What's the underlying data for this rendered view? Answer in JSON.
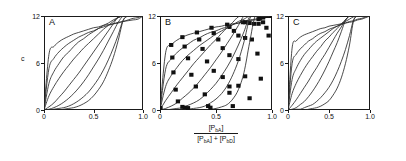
{
  "figure": {
    "y_axis_name": "c",
    "x_axis_label": {
      "numerator_prefix": "[P",
      "numerator_sub": "bA",
      "numerator_suffix": "]",
      "denominator_left_prefix": "[P",
      "denominator_left_sub": "bA",
      "denominator_left_suffix": "]",
      "denominator_operator": "+",
      "denominator_right_prefix": "[P",
      "denominator_right_sub": "bD",
      "denominator_right_suffix": "]"
    },
    "y_ticks": [
      "0",
      "6",
      "12"
    ],
    "y_tick_values": [
      0,
      6,
      12
    ],
    "x_ticks": [
      "0",
      "0.5",
      "1.0"
    ],
    "x_tick_values": [
      0,
      0.5,
      1.0
    ],
    "line_color": "#2b2b2b",
    "axis_color": "#1a1a1a",
    "marker_color": "#111111"
  },
  "chart_data": [
    {
      "type": "line",
      "panel": "A",
      "title": "A",
      "xlabel": "[PbA] / ([PbA] + [PbD])",
      "ylabel": "c",
      "xlim": [
        0,
        1
      ],
      "ylim": [
        0,
        12
      ],
      "grid": false,
      "legend": "none",
      "markers": false,
      "note": "Family of monotonic curves from (0,0) to (1,12) forming a lens/eye shape; curvature exponent varies per series.",
      "x": [
        0,
        0.05,
        0.1,
        0.15,
        0.2,
        0.25,
        0.3,
        0.35,
        0.4,
        0.45,
        0.5,
        0.55,
        0.6,
        0.65,
        0.7,
        0.75,
        0.8,
        0.85,
        0.9,
        0.95,
        1.0
      ],
      "series": [
        {
          "name": "n=0.18",
          "exponent": 0.18,
          "values": [
            0,
            7.1,
            8.1,
            8.7,
            9.1,
            9.4,
            9.7,
            9.9,
            10.1,
            10.3,
            10.5,
            10.6,
            10.8,
            10.9,
            11.0,
            11.1,
            11.3,
            11.4,
            11.5,
            11.6,
            12.0
          ]
        },
        {
          "name": "n=0.32",
          "exponent": 0.32,
          "values": [
            0,
            5.3,
            6.6,
            7.4,
            8.0,
            8.5,
            8.9,
            9.3,
            9.6,
            9.9,
            10.1,
            10.4,
            10.6,
            10.8,
            11.0,
            11.2,
            11.3,
            11.5,
            11.7,
            11.8,
            12.0
          ]
        },
        {
          "name": "n=0.50",
          "exponent": 0.5,
          "values": [
            0,
            3.4,
            4.9,
            5.9,
            6.8,
            7.4,
            8.1,
            8.7,
            9.1,
            9.6,
            10.0,
            10.4,
            10.8,
            11.1,
            11.5,
            11.8,
            12.0,
            12.0,
            12.0,
            12.0,
            12.0
          ]
        },
        {
          "name": "n=0.75",
          "exponent": 0.75,
          "values": [
            0,
            1.8,
            3.0,
            4.0,
            4.9,
            5.7,
            6.5,
            7.2,
            7.9,
            8.5,
            9.1,
            9.7,
            10.3,
            10.8,
            11.3,
            11.8,
            12.0,
            12.0,
            12.0,
            12.0,
            12.0
          ]
        },
        {
          "name": "n=1.35",
          "exponent": 1.35,
          "values": [
            0,
            0.4,
            0.9,
            1.6,
            2.3,
            3.1,
            3.9,
            4.7,
            5.6,
            6.5,
            7.4,
            8.3,
            9.2,
            10.1,
            11.0,
            11.9,
            12.0,
            12.0,
            12.0,
            12.0,
            12.0
          ]
        },
        {
          "name": "n=2.2",
          "exponent": 2.2,
          "values": [
            0,
            0.1,
            0.3,
            0.6,
            1.0,
            1.5,
            2.1,
            2.8,
            3.6,
            4.5,
            5.5,
            6.5,
            7.6,
            8.8,
            10.0,
            11.2,
            12.0,
            12.0,
            12.0,
            12.0,
            12.0
          ]
        },
        {
          "name": "n=3.6",
          "exponent": 3.6,
          "values": [
            0,
            0.0,
            0.1,
            0.2,
            0.3,
            0.5,
            0.8,
            1.2,
            1.7,
            2.3,
            3.1,
            4.0,
            5.1,
            6.4,
            7.9,
            9.6,
            11.5,
            12.0,
            12.0,
            12.0,
            12.0
          ]
        },
        {
          "name": "n=6.0",
          "exponent": 6.0,
          "values": [
            0,
            0.0,
            0.0,
            0.0,
            0.1,
            0.2,
            0.3,
            0.5,
            0.8,
            1.2,
            1.8,
            2.6,
            3.6,
            5.0,
            6.7,
            8.9,
            11.4,
            12.0,
            12.0,
            12.0,
            12.0
          ]
        }
      ]
    },
    {
      "type": "line",
      "panel": "B",
      "title": "B",
      "xlabel": "[PbA] / ([PbA] + [PbD])",
      "ylabel": "c",
      "xlim": [
        0,
        1
      ],
      "ylim": [
        0,
        12
      ],
      "grid": false,
      "legend": "none",
      "markers": true,
      "marker_shape": "square",
      "note": "Fitted curves with filled square data points overlaid; curves saturate at c=12 near x=1.",
      "x": [
        0,
        0.05,
        0.1,
        0.15,
        0.2,
        0.25,
        0.3,
        0.35,
        0.4,
        0.45,
        0.5,
        0.55,
        0.6,
        0.65,
        0.7,
        0.75,
        0.8,
        0.85,
        0.9,
        0.95,
        1.0
      ],
      "series": [
        {
          "name": "B1",
          "exponent": 0.17,
          "values": [
            0,
            7.3,
            8.3,
            8.9,
            9.3,
            9.6,
            9.8,
            10.0,
            10.2,
            10.4,
            10.6,
            10.7,
            10.9,
            11.0,
            11.1,
            11.3,
            11.4,
            11.5,
            11.6,
            11.8,
            12.0
          ],
          "points": [
            [
              0.0,
              0.2
            ],
            [
              0.1,
              8.3
            ],
            [
              0.2,
              9.3
            ],
            [
              0.33,
              9.9
            ],
            [
              0.46,
              10.5
            ],
            [
              0.6,
              10.9
            ],
            [
              0.74,
              11.2
            ],
            [
              0.88,
              11.6
            ],
            [
              1.0,
              12.0
            ]
          ]
        },
        {
          "name": "B2",
          "exponent": 0.33,
          "values": [
            0,
            5.2,
            6.5,
            7.3,
            7.9,
            8.4,
            8.9,
            9.2,
            9.6,
            9.9,
            10.1,
            10.4,
            10.6,
            10.9,
            11.1,
            11.3,
            11.5,
            11.6,
            11.8,
            11.9,
            12.0
          ],
          "points": [
            [
              0.0,
              0.2
            ],
            [
              0.11,
              6.7
            ],
            [
              0.22,
              8.1
            ],
            [
              0.35,
              9.0
            ],
            [
              0.48,
              9.8
            ],
            [
              0.62,
              10.6
            ],
            [
              0.76,
              11.2
            ],
            [
              0.89,
              11.7
            ],
            [
              1.0,
              12.0
            ]
          ]
        },
        {
          "name": "B3",
          "exponent": 0.55,
          "values": [
            0,
            3.0,
            4.4,
            5.4,
            6.3,
            7.0,
            7.6,
            8.2,
            8.7,
            9.2,
            9.7,
            10.1,
            10.5,
            10.9,
            11.3,
            11.6,
            12.0,
            12.0,
            12.0,
            12.0,
            12.0
          ],
          "points": [
            [
              0.0,
              0.2
            ],
            [
              0.12,
              4.8
            ],
            [
              0.25,
              6.6
            ],
            [
              0.38,
              7.8
            ],
            [
              0.52,
              9.0
            ],
            [
              0.66,
              10.1
            ],
            [
              0.8,
              11.1
            ],
            [
              0.92,
              11.8
            ],
            [
              1.0,
              12.0
            ]
          ]
        },
        {
          "name": "B4",
          "exponent": 0.95,
          "values": [
            0,
            1.2,
            2.2,
            3.2,
            4.1,
            5.0,
            5.9,
            6.7,
            7.5,
            8.3,
            9.0,
            9.8,
            10.5,
            11.2,
            11.9,
            12.0,
            12.0,
            12.0,
            12.0,
            12.0,
            12.0
          ],
          "points": [
            [
              0.0,
              0.2
            ],
            [
              0.14,
              2.6
            ],
            [
              0.28,
              4.5
            ],
            [
              0.42,
              6.2
            ],
            [
              0.56,
              7.9
            ],
            [
              0.7,
              9.5
            ],
            [
              0.84,
              11.0
            ],
            [
              0.95,
              12.0
            ],
            [
              1.0,
              12.0
            ]
          ]
        },
        {
          "name": "B5",
          "exponent": 1.8,
          "values": [
            0,
            0.2,
            0.5,
            0.9,
            1.5,
            2.1,
            2.8,
            3.6,
            4.5,
            5.4,
            6.4,
            7.4,
            8.5,
            9.6,
            10.8,
            12.0,
            12.0,
            12.0,
            12.0,
            12.0,
            12.0
          ],
          "points": [
            [
              0.0,
              0.2
            ],
            [
              0.16,
              1.1
            ],
            [
              0.32,
              3.0
            ],
            [
              0.48,
              5.0
            ],
            [
              0.62,
              7.0
            ],
            [
              0.76,
              9.2
            ],
            [
              0.88,
              11.0
            ],
            [
              0.97,
              12.0
            ],
            [
              1.0,
              12.0
            ]
          ]
        },
        {
          "name": "B6",
          "exponent": 3.4,
          "values": [
            0,
            0.0,
            0.1,
            0.2,
            0.3,
            0.6,
            0.9,
            1.3,
            1.9,
            2.6,
            3.4,
            4.4,
            5.5,
            6.8,
            8.3,
            10.0,
            11.9,
            12.0,
            12.0,
            12.0,
            12.0
          ],
          "points": [
            [
              0.0,
              0.2
            ],
            [
              0.2,
              0.4
            ],
            [
              0.4,
              2.0
            ],
            [
              0.56,
              4.2
            ],
            [
              0.7,
              6.5
            ],
            [
              0.82,
              9.0
            ],
            [
              0.92,
              11.2
            ],
            [
              1.0,
              12.0
            ]
          ]
        },
        {
          "name": "B7",
          "exponent": 7.0,
          "values": [
            0,
            0.0,
            0.0,
            0.0,
            0.0,
            0.1,
            0.2,
            0.3,
            0.5,
            0.9,
            1.4,
            2.1,
            3.1,
            4.5,
            6.3,
            8.7,
            11.6,
            12.0,
            12.0,
            12.0,
            12.0
          ],
          "points": [
            [
              0.0,
              0.2
            ],
            [
              0.22,
              0.3
            ],
            [
              0.43,
              0.5
            ],
            [
              0.62,
              2.2
            ],
            [
              0.76,
              4.3
            ],
            [
              0.87,
              7.2
            ],
            [
              0.95,
              10.5
            ],
            [
              1.0,
              12.0
            ]
          ]
        },
        {
          "name": "B8",
          "exponent": 14.0,
          "values": [
            0,
            0.0,
            0.0,
            0.0,
            0.0,
            0.0,
            0.0,
            0.0,
            0.0,
            0.1,
            0.2,
            0.4,
            0.7,
            1.4,
            2.6,
            4.8,
            8.6,
            12.0,
            12.0,
            12.0,
            12.0
          ],
          "points": [
            [
              0.0,
              0.2
            ],
            [
              0.25,
              0.25
            ],
            [
              0.45,
              0.3
            ],
            [
              0.65,
              0.5
            ],
            [
              0.8,
              1.5
            ],
            [
              0.9,
              4.0
            ],
            [
              0.97,
              9.5
            ],
            [
              1.0,
              12.0
            ]
          ]
        },
        {
          "name": "B-stray",
          "exponent": 0,
          "values": [],
          "points": [
            [
              0.62,
              3.0
            ],
            [
              0.7,
              3.1
            ]
          ]
        }
      ]
    },
    {
      "type": "line",
      "panel": "C",
      "title": "C",
      "xlabel": "[PbA] / ([PbA] + [PbD])",
      "ylabel": "c",
      "xlim": [
        0,
        1
      ],
      "ylim": [
        0,
        12
      ],
      "grid": false,
      "legend": "none",
      "markers": false,
      "note": "Same family of curves as A, computed model; lens-shaped envelope from (0,0) to (1,12).",
      "x": [
        0,
        0.05,
        0.1,
        0.15,
        0.2,
        0.25,
        0.3,
        0.35,
        0.4,
        0.45,
        0.5,
        0.55,
        0.6,
        0.65,
        0.7,
        0.75,
        0.8,
        0.85,
        0.9,
        0.95,
        1.0
      ],
      "series": [
        {
          "name": "C1",
          "exponent": 0.14,
          "values": [
            0,
            7.9,
            8.8,
            9.3,
            9.6,
            9.8,
            10.0,
            10.2,
            10.4,
            10.5,
            10.7,
            10.8,
            10.9,
            11.0,
            11.1,
            11.2,
            11.3,
            11.5,
            11.6,
            11.8,
            12.0
          ]
        },
        {
          "name": "C2",
          "exponent": 0.28,
          "values": [
            0,
            5.9,
            7.1,
            7.8,
            8.3,
            8.8,
            9.1,
            9.5,
            9.8,
            10.0,
            10.3,
            10.5,
            10.7,
            10.9,
            11.1,
            11.3,
            11.4,
            11.6,
            11.7,
            11.9,
            12.0
          ]
        },
        {
          "name": "C3",
          "exponent": 0.45,
          "values": [
            0,
            3.9,
            5.3,
            6.3,
            7.1,
            7.7,
            8.3,
            8.8,
            9.2,
            9.6,
            10.0,
            10.4,
            10.7,
            11.0,
            11.3,
            11.6,
            11.9,
            12.0,
            12.0,
            12.0,
            12.0
          ]
        },
        {
          "name": "C4",
          "exponent": 0.7,
          "values": [
            0,
            2.1,
            3.4,
            4.4,
            5.3,
            6.1,
            6.8,
            7.5,
            8.1,
            8.8,
            9.3,
            9.9,
            10.4,
            11.0,
            11.5,
            12.0,
            12.0,
            12.0,
            12.0,
            12.0,
            12.0
          ]
        },
        {
          "name": "C5",
          "exponent": 1.2,
          "values": [
            0,
            0.6,
            1.3,
            2.1,
            2.9,
            3.7,
            4.6,
            5.4,
            6.3,
            7.1,
            8.0,
            8.9,
            9.8,
            10.6,
            11.5,
            12.0,
            12.0,
            12.0,
            12.0,
            12.0,
            12.0
          ]
        },
        {
          "name": "C6",
          "exponent": 2.0,
          "values": [
            0,
            0.1,
            0.3,
            0.7,
            1.1,
            1.7,
            2.4,
            3.2,
            4.1,
            5.1,
            6.2,
            7.4,
            8.6,
            10.0,
            11.4,
            12.0,
            12.0,
            12.0,
            12.0,
            12.0,
            12.0
          ]
        },
        {
          "name": "C7",
          "exponent": 3.8,
          "values": [
            0,
            0.0,
            0.1,
            0.1,
            0.3,
            0.5,
            0.7,
            1.1,
            1.6,
            2.2,
            2.9,
            3.8,
            4.9,
            6.2,
            7.7,
            9.5,
            11.5,
            12.0,
            12.0,
            12.0,
            12.0
          ]
        },
        {
          "name": "C8",
          "exponent": 7.5,
          "values": [
            0,
            0.0,
            0.0,
            0.0,
            0.0,
            0.1,
            0.2,
            0.3,
            0.5,
            0.8,
            1.2,
            1.9,
            2.8,
            4.1,
            5.9,
            8.3,
            11.4,
            12.0,
            12.0,
            12.0,
            12.0
          ]
        }
      ]
    }
  ]
}
